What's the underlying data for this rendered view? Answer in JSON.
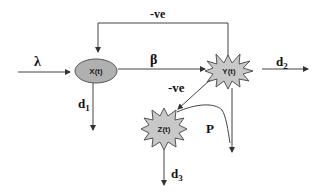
{
  "nodes": {
    "x": {
      "label": "X(t)",
      "shape": "ellipse",
      "fill": "#b0b0b0"
    },
    "y": {
      "label": "Y(t)",
      "shape": "starburst",
      "fill": "#c8c8c8"
    },
    "z": {
      "label": "Z(t)",
      "shape": "starburst",
      "fill": "#c8c8c8"
    }
  },
  "edges": {
    "input": {
      "label": "λ"
    },
    "x_to_y": {
      "label": "β"
    },
    "y_to_x_feedback": {
      "label": "-ve"
    },
    "y_to_z": {
      "label": "-ve"
    },
    "x_out": {
      "label": "d",
      "sub": "1"
    },
    "y_out": {
      "label": "d",
      "sub": "2"
    },
    "z_out": {
      "label": "d",
      "sub": "3"
    },
    "z_to_yline": {
      "label": "P"
    }
  },
  "colors": {
    "line": "#444444",
    "node_stroke": "#555555"
  }
}
